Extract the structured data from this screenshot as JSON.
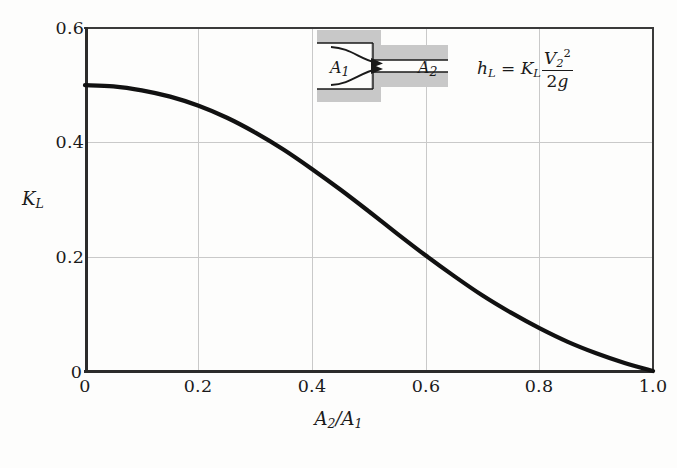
{
  "figure": {
    "background": "#ffffff",
    "curve_color": "#111111",
    "grid_color": "#c9c9c9",
    "axis_color": "#2b2b2b",
    "inset_wall_color": "#c8c8c8"
  },
  "axes": {
    "y_title": "K",
    "y_title_sub": "L",
    "x_title_num": "A",
    "x_title_num_sub": "2",
    "x_title_slash": "/",
    "x_title_den": "A",
    "x_title_den_sub": "1",
    "x_ticks": [
      "0",
      "0.2",
      "0.4",
      "0.6",
      "0.8",
      "1.0"
    ],
    "y_ticks": [
      "0",
      "0.2",
      "0.4",
      "0.6"
    ],
    "origin_y_label": "0"
  },
  "equation": {
    "lhs_var": "h",
    "lhs_sub": "L",
    "equals": "=",
    "k_var": "K",
    "k_sub": "L",
    "numerator": "V",
    "numerator_sub": "2",
    "numerator_sup": "2",
    "denominator_num": "2",
    "denominator_var": "g",
    "plain": "h_L = K_L V_2^2 / 2g"
  },
  "inset": {
    "label_inlet": "A",
    "label_inlet_sub": "1",
    "label_outlet": "A",
    "label_outlet_sub": "2",
    "description": "sudden-contraction-pipe-diagram"
  },
  "chart_data": {
    "type": "line",
    "title": "",
    "subtitle": "",
    "xlabel": "A2/A1",
    "ylabel": "KL",
    "xlim": [
      0,
      1.0
    ],
    "ylim": [
      0,
      0.6
    ],
    "grid": true,
    "legend": false,
    "xticks": [
      0,
      0.2,
      0.4,
      0.6,
      0.8,
      1.0
    ],
    "yticks": [
      0,
      0.2,
      0.4,
      0.6
    ],
    "series": [
      {
        "name": "Sudden contraction loss coefficient",
        "x": [
          0.0,
          0.05,
          0.1,
          0.15,
          0.2,
          0.25,
          0.3,
          0.35,
          0.4,
          0.45,
          0.5,
          0.55,
          0.6,
          0.65,
          0.7,
          0.75,
          0.8,
          0.85,
          0.9,
          0.95,
          1.0
        ],
        "values": [
          0.5,
          0.498,
          0.491,
          0.48,
          0.464,
          0.443,
          0.417,
          0.387,
          0.353,
          0.317,
          0.279,
          0.24,
          0.202,
          0.166,
          0.132,
          0.102,
          0.075,
          0.051,
          0.031,
          0.014,
          0.0
        ]
      }
    ],
    "annotations": [
      {
        "text": "h_L = K_L V_2^2/(2g)",
        "type": "equation"
      },
      {
        "text": "A_1",
        "type": "inset-label"
      },
      {
        "text": "A_2",
        "type": "inset-label"
      }
    ]
  }
}
